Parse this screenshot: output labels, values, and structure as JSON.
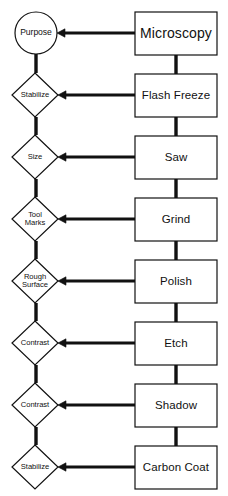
{
  "diagram": {
    "background_color": "#ffffff",
    "stroke_color": "#111111",
    "fill_color": "#ffffff",
    "left_column": {
      "label": "Purpose / condition nodes",
      "nodes": [
        {
          "id": "purpose",
          "shape": "circle",
          "label": "Purpose",
          "cx": 36,
          "cy": 33,
          "rx": 21,
          "ry": 21
        },
        {
          "id": "stabilize-1",
          "shape": "diamond",
          "label": "Stabilize",
          "cx": 35,
          "cy": 95,
          "rx": 23,
          "ry": 22
        },
        {
          "id": "size",
          "shape": "diamond",
          "label": "Size",
          "cx": 35,
          "cy": 157,
          "rx": 23,
          "ry": 22
        },
        {
          "id": "tool-marks",
          "shape": "diamond",
          "label": "Tool\nMarks",
          "cx": 35,
          "cy": 219,
          "rx": 23,
          "ry": 22
        },
        {
          "id": "rough-surface",
          "shape": "diamond",
          "label": "Rough\nSurface",
          "cx": 35,
          "cy": 281,
          "rx": 23,
          "ry": 22
        },
        {
          "id": "contrast-1",
          "shape": "diamond",
          "label": "Contrast",
          "cx": 35,
          "cy": 343,
          "rx": 23,
          "ry": 22
        },
        {
          "id": "contrast-2",
          "shape": "diamond",
          "label": "Contrast",
          "cx": 35,
          "cy": 405,
          "rx": 23,
          "ry": 22
        },
        {
          "id": "stabilize-2",
          "shape": "diamond",
          "label": "Stabilize",
          "cx": 35,
          "cy": 467,
          "rx": 23,
          "ry": 22
        }
      ]
    },
    "right_column": {
      "label": "Process step boxes",
      "nodes": [
        {
          "id": "microscopy",
          "shape": "rect",
          "label": "Microscopy",
          "x": 135,
          "y": 12,
          "w": 82,
          "h": 43,
          "emphasis": true
        },
        {
          "id": "flash-freeze",
          "shape": "rect",
          "label": "Flash Freeze",
          "x": 135,
          "y": 74,
          "w": 82,
          "h": 43,
          "emphasis": false
        },
        {
          "id": "saw",
          "shape": "rect",
          "label": "Saw",
          "x": 135,
          "y": 136,
          "w": 82,
          "h": 43,
          "emphasis": false
        },
        {
          "id": "grind",
          "shape": "rect",
          "label": "Grind",
          "x": 135,
          "y": 198,
          "w": 82,
          "h": 43,
          "emphasis": false
        },
        {
          "id": "polish",
          "shape": "rect",
          "label": "Polish",
          "x": 135,
          "y": 260,
          "w": 82,
          "h": 43,
          "emphasis": false
        },
        {
          "id": "etch",
          "shape": "rect",
          "label": "Etch",
          "x": 135,
          "y": 322,
          "w": 82,
          "h": 43,
          "emphasis": false
        },
        {
          "id": "shadow",
          "shape": "rect",
          "label": "Shadow",
          "x": 135,
          "y": 384,
          "w": 82,
          "h": 43,
          "emphasis": false
        },
        {
          "id": "carbon-coat",
          "shape": "rect",
          "label": "Carbon Coat",
          "x": 135,
          "y": 446,
          "w": 82,
          "h": 43,
          "emphasis": false
        }
      ]
    },
    "connectors": {
      "horizontal": [
        {
          "id": "microscopy-to-purpose",
          "from": "microscopy",
          "to": "purpose",
          "y": 33,
          "x_from": 135,
          "x_to": 57,
          "arrow": "left"
        },
        {
          "id": "flash-freeze-to-stabilize-1",
          "from": "flash-freeze",
          "to": "stabilize-1",
          "y": 95,
          "x_from": 135,
          "x_to": 58,
          "arrow": "left"
        },
        {
          "id": "saw-to-size",
          "from": "saw",
          "to": "size",
          "y": 157,
          "x_from": 135,
          "x_to": 58,
          "arrow": "left"
        },
        {
          "id": "grind-to-tool-marks",
          "from": "grind",
          "to": "tool-marks",
          "y": 219,
          "x_from": 135,
          "x_to": 58,
          "arrow": "left"
        },
        {
          "id": "polish-to-rough-surface",
          "from": "polish",
          "to": "rough-surface",
          "y": 281,
          "x_from": 135,
          "x_to": 58,
          "arrow": "left"
        },
        {
          "id": "etch-to-contrast-1",
          "from": "etch",
          "to": "contrast-1",
          "y": 343,
          "x_from": 135,
          "x_to": 58,
          "arrow": "left"
        },
        {
          "id": "shadow-to-contrast-2",
          "from": "shadow",
          "to": "contrast-2",
          "y": 405,
          "x_from": 135,
          "x_to": 58,
          "arrow": "left"
        },
        {
          "id": "carbon-coat-to-stabilize-2",
          "from": "carbon-coat",
          "to": "stabilize-2",
          "y": 467,
          "x_from": 135,
          "x_to": 58,
          "arrow": "left"
        }
      ],
      "vertical_left": [
        {
          "id": "purpose-to-stabilize-1",
          "x": 36,
          "y_from": 54,
          "y_to": 73
        },
        {
          "id": "stabilize-1-to-size",
          "x": 36,
          "y_from": 117,
          "y_to": 135
        },
        {
          "id": "size-to-tool-marks",
          "x": 36,
          "y_from": 179,
          "y_to": 197
        },
        {
          "id": "tool-marks-to-rough-surface",
          "x": 36,
          "y_from": 241,
          "y_to": 259
        },
        {
          "id": "rough-surface-to-contrast-1",
          "x": 36,
          "y_from": 303,
          "y_to": 321
        },
        {
          "id": "contrast-1-to-contrast-2",
          "x": 36,
          "y_from": 365,
          "y_to": 383
        },
        {
          "id": "contrast-2-to-stabilize-2",
          "x": 36,
          "y_from": 427,
          "y_to": 445
        }
      ],
      "vertical_right": [
        {
          "id": "microscopy-to-flash-freeze",
          "x": 176,
          "y_from": 55,
          "y_to": 74
        },
        {
          "id": "flash-freeze-to-saw",
          "x": 176,
          "y_from": 117,
          "y_to": 136
        },
        {
          "id": "saw-to-grind",
          "x": 176,
          "y_from": 179,
          "y_to": 198
        },
        {
          "id": "grind-to-polish",
          "x": 176,
          "y_from": 241,
          "y_to": 260
        },
        {
          "id": "polish-to-etch",
          "x": 176,
          "y_from": 303,
          "y_to": 322
        },
        {
          "id": "etch-to-shadow",
          "x": 176,
          "y_from": 365,
          "y_to": 384
        },
        {
          "id": "shadow-to-carbon-coat",
          "x": 176,
          "y_from": 427,
          "y_to": 446
        }
      ]
    }
  }
}
